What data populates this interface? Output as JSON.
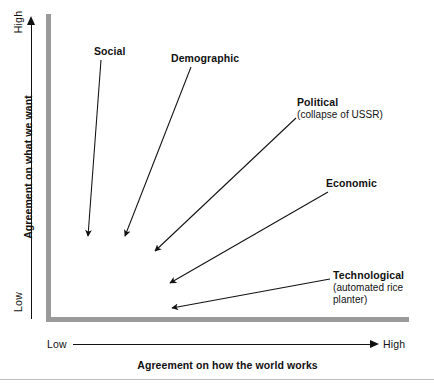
{
  "figure": {
    "type": "diagram",
    "subtype": "2x2-agreement-matrix-with-vectors",
    "background_color": "#ffffff",
    "axis_bar_color": "#9a9a9a",
    "line_color": "#111111",
    "rule_color": "#bdbdbd"
  },
  "axes": {
    "y": {
      "title": "Agreement on what we want",
      "high_label": "High",
      "low_label": "Low",
      "direction": "up"
    },
    "x": {
      "title": "Agreement on how the world works",
      "high_label": "High",
      "low_label": "Low",
      "direction": "right"
    }
  },
  "annotations": [
    {
      "id": "social",
      "title": "Social",
      "subtitle": "",
      "arrow": {
        "x1": 101,
        "y1": 60,
        "x2": 88,
        "y2": 236
      },
      "direction": "down-slightly-left"
    },
    {
      "id": "demographic",
      "title": "Demographic",
      "subtitle": "",
      "arrow": {
        "x1": 191,
        "y1": 67,
        "x2": 125,
        "y2": 236
      },
      "direction": "down-left"
    },
    {
      "id": "political",
      "title": "Political",
      "subtitle": "(collapse of USSR)",
      "arrow": {
        "x1": 296,
        "y1": 118,
        "x2": 155,
        "y2": 251
      },
      "direction": "down-left"
    },
    {
      "id": "economic",
      "title": "Economic",
      "subtitle": "",
      "arrow": {
        "x1": 328,
        "y1": 192,
        "x2": 170,
        "y2": 283
      },
      "direction": "down-left-shallow"
    },
    {
      "id": "technological",
      "title": "Technological",
      "subtitle": "(automated rice\nplanter)",
      "subtitle_lines": [
        "(automated rice",
        "planter)"
      ],
      "arrow": {
        "x1": 330,
        "y1": 279,
        "x2": 172,
        "y2": 308
      },
      "direction": "left-shallow"
    }
  ]
}
